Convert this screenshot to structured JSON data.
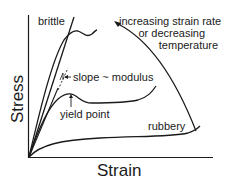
{
  "figure": {
    "type": "stress-strain diagram",
    "axes": {
      "xlabel": "Strain",
      "ylabel": "Stress"
    },
    "curves": [
      {
        "name": "brittle",
        "label": "brittle"
      },
      {
        "name": "ductile-high",
        "label": ""
      },
      {
        "name": "yield",
        "label": "yield point"
      },
      {
        "name": "rubbery",
        "label": "rubbery"
      }
    ],
    "annotations": {
      "slope": "slope ~ modulus",
      "yield_point": "yield point",
      "trend_line1": "increasing strain rate",
      "trend_line2": "or decreasing",
      "trend_line3": "temperature"
    },
    "colors": {
      "ink": "#1a1a1a",
      "background": "#ffffff"
    }
  }
}
